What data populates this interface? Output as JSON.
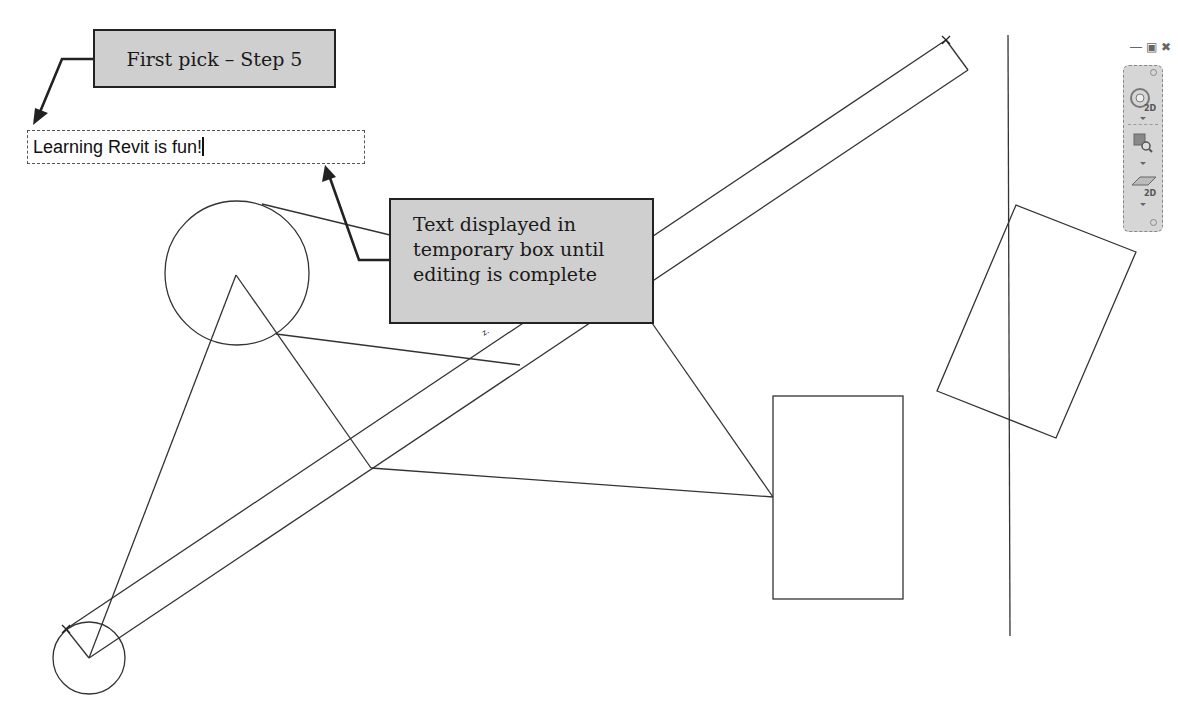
{
  "callouts": {
    "first_pick": "First pick – Step 5",
    "temporary_box": [
      "Text displayed in",
      "temporary box until",
      "editing is complete"
    ]
  },
  "text_editor": {
    "value": "Learning Revit is fun!"
  },
  "window_controls": {
    "minimize": "—",
    "restore": "▣",
    "close": "✖"
  },
  "navigation_bar": {
    "items": [
      {
        "name": "2D Wheel",
        "label": "2D"
      },
      {
        "name": "Zoom",
        "label": ""
      },
      {
        "name": "2D Plan",
        "label": "2D"
      }
    ]
  },
  "colors": {
    "line": "#333333",
    "callout_fill": "#cfcfcf",
    "callout_border": "#222222",
    "navbar_fill": "#d6d6d6"
  }
}
